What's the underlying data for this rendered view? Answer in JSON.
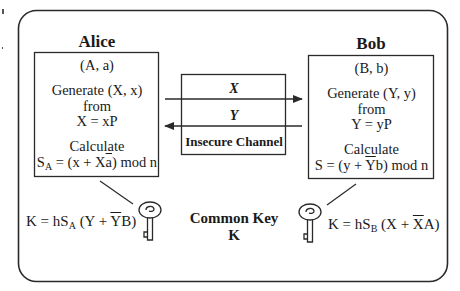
{
  "diagram": {
    "alice": {
      "name": "Alice",
      "keypair": "(A, a)",
      "generate_lines": [
        "Generate (X, x)",
        "from",
        "X = xP"
      ],
      "calculate_label": "Calculate",
      "calc": {
        "lhs": "S",
        "lhs_sub": "A",
        "pre": " = (x + X",
        "bar": "a",
        "post": ") mod n"
      },
      "key": {
        "pre": "K = hS",
        "sub": "A",
        "mid": " (Y + ",
        "bar": "Y",
        "post": "B)"
      }
    },
    "bob": {
      "name": "Bob",
      "keypair": "(B, b)",
      "generate_lines": [
        "Generate (Y, y)",
        "from",
        "Y = yP"
      ],
      "calculate_label": "Calculate",
      "calc": {
        "lhs": "S",
        "pre": " = (y + ",
        "bar": "Y",
        "post": "b) mod n"
      },
      "key": {
        "pre": "K = hS",
        "sub": "B",
        "mid": " (X + ",
        "bar": "X",
        "post": "A)"
      }
    },
    "channel": {
      "label": "Insecure Channel",
      "messages": [
        {
          "label": "X",
          "direction": "alice-to-bob"
        },
        {
          "label": "Y",
          "direction": "bob-to-alice"
        }
      ]
    },
    "common_key": {
      "line1": "Common Key",
      "line2": "K"
    },
    "icons": {
      "alice_key": "key-icon",
      "bob_key": "key-icon"
    },
    "colors": {
      "stroke": "#2a2a2a",
      "background": "#ffffff",
      "text": "#1a1a1a"
    }
  }
}
